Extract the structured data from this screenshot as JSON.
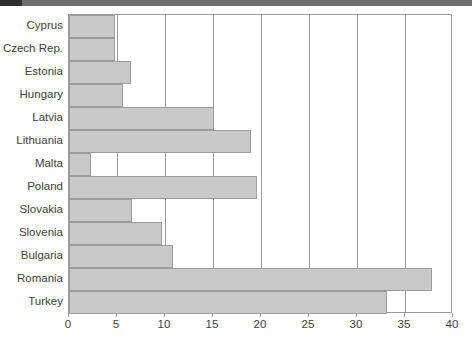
{
  "chart_data": {
    "type": "bar",
    "orientation": "horizontal",
    "title": "",
    "subtitle": "",
    "xlabel": "",
    "ylabel": "",
    "xlim": [
      0,
      40
    ],
    "ylim": null,
    "xticks": [
      0,
      5,
      10,
      15,
      20,
      25,
      30,
      35,
      40
    ],
    "xtick_labels": [
      "0",
      "5",
      "10",
      "15",
      "20",
      "25",
      "30",
      "35",
      "40"
    ],
    "grid": "vertical",
    "legend": null,
    "legend_position": "none",
    "categories": [
      "Cyprus",
      "Czech Rep.",
      "Estonia",
      "Hungary",
      "Latvia",
      "Lithuania",
      "Malta",
      "Poland",
      "Slovakia",
      "Slovenia",
      "Bulgaria",
      "Romania",
      "Turkey"
    ],
    "values": [
      4.8,
      4.8,
      6.5,
      5.6,
      15.1,
      19.0,
      2.3,
      19.6,
      6.6,
      9.7,
      10.8,
      37.8,
      33.1
    ],
    "series": [
      {
        "name": "",
        "values": [
          4.8,
          4.8,
          6.5,
          5.6,
          15.1,
          19.0,
          2.3,
          19.6,
          6.6,
          9.7,
          10.8,
          37.8,
          33.1
        ]
      }
    ],
    "annotations": []
  },
  "style": {
    "bar_fill": "#c9c9c9",
    "bar_border": "#9d9d9d",
    "axis_color": "#9a9a9a",
    "grid_color": "#9a9a9a",
    "text_color": "#3f3f3f",
    "background": "#ffffff",
    "top_band": "#6e6e6e"
  }
}
